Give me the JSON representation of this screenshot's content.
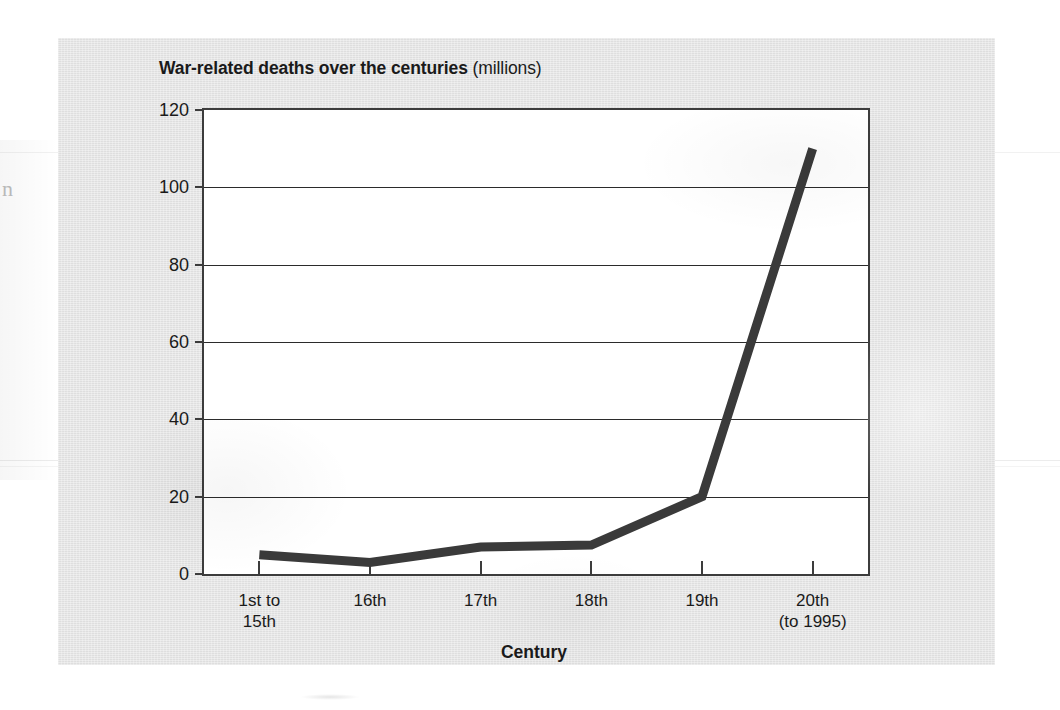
{
  "chart_data": {
    "type": "line",
    "title": "War-related deaths over the centuries (millions)",
    "title_main": "War-related deaths over the centuries",
    "title_unit": "(millions)",
    "xlabel": "Century",
    "ylabel": "",
    "categories": [
      "1st to 15th",
      "16th",
      "17th",
      "18th",
      "19th",
      "20th (to 1995)"
    ],
    "category_lines": [
      [
        "1st to",
        "15th"
      ],
      [
        "16th"
      ],
      [
        "17th"
      ],
      [
        "18th"
      ],
      [
        "19th"
      ],
      [
        "20th",
        "(to 1995)"
      ]
    ],
    "values": [
      5,
      3,
      7,
      7.5,
      20,
      110
    ],
    "ylim": [
      0,
      120
    ],
    "yticks": [
      0,
      20,
      40,
      60,
      80,
      100,
      120
    ],
    "ytick_labels": [
      "0",
      "20",
      "40",
      "60",
      "80",
      "100",
      "120"
    ],
    "grid": true,
    "grid_axis": "y",
    "legend": false,
    "series_color": "#3a3a3a",
    "series_width": 9,
    "axis_color": "#3c3c3c",
    "plot_background": "#ffffff",
    "panel_background": "#e4e4e4"
  },
  "artifacts": {
    "left_margin_glyph": "n"
  }
}
